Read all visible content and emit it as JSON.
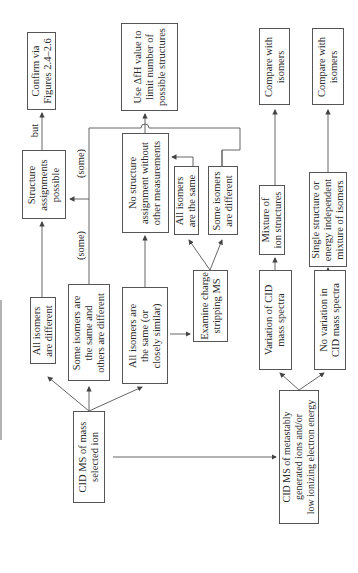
{
  "diagram": {
    "orientation": "rotated 90 degrees counter-clockwise",
    "nodes": {
      "start": {
        "lines": [
          "CID MS of mass",
          "selected ion"
        ]
      },
      "all_different": {
        "lines": [
          "All isomers",
          "are different"
        ]
      },
      "some_same": {
        "lines": [
          "Some isomers are",
          "the same and",
          "others are different"
        ]
      },
      "all_same": {
        "lines": [
          "All isomers are",
          "the same (or",
          "closely similar)"
        ]
      },
      "structure_possible": {
        "lines": [
          "Structure",
          "assignments",
          "possible"
        ]
      },
      "confirm": {
        "lines": [
          "Confirm via",
          "Figures 2.4–2.6"
        ]
      },
      "no_structure": {
        "lines": [
          "No structure",
          "assignment without",
          "other measurements"
        ]
      },
      "use_dfh": {
        "lines": [
          "Use ΔfH value to",
          "limit number of",
          "possible structures"
        ]
      },
      "charge_stripping": {
        "lines": [
          "Examine charge",
          "stripping MS"
        ]
      },
      "cs_all_same": {
        "lines": [
          "All isomers",
          "are the same"
        ]
      },
      "cs_some_different": {
        "lines": [
          "Some isomers",
          "are different"
        ]
      },
      "metastable": {
        "lines": [
          "CID MS of metastably",
          "generated ions and/or",
          "low ionizing electron energy"
        ]
      },
      "variation": {
        "lines": [
          "Variation of CID",
          "mass spectra"
        ]
      },
      "no_variation": {
        "lines": [
          "No variation in",
          "CID mass spectra"
        ]
      },
      "mixture": {
        "lines": [
          "Mixture of",
          "ion structures"
        ]
      },
      "single_structure": {
        "lines": [
          "Single structure or",
          "energy independent",
          "mixture of isomers"
        ]
      },
      "compare1": {
        "lines": [
          "Compare with",
          "isomers"
        ]
      },
      "compare2": {
        "lines": [
          "Compare with",
          "isomers"
        ]
      }
    },
    "edge_labels": {
      "some_1": "(some)",
      "some_2": "(some)",
      "but": "but"
    },
    "colors": {
      "line": "#555555",
      "text": "#2a2a2a",
      "background": "#ffffff"
    }
  }
}
